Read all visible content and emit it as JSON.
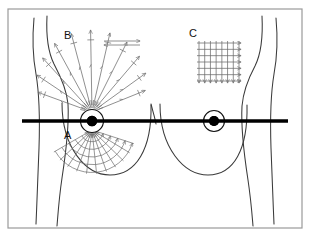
{
  "figure": {
    "background_color": "#ffffff",
    "frame": {
      "name": "outer-frame",
      "x": 8,
      "y": 9,
      "width": 294,
      "height": 219,
      "stroke_color": "#9a9a9a",
      "stroke_width": 1.2
    },
    "ink_color": "#1a1a1a",
    "pattern_color": "#6b6b6b",
    "line_color": "#3a3a3a"
  },
  "labels": [
    {
      "id": "label-a",
      "text": "A",
      "x": 64,
      "y": 139,
      "description": "Wedge / radial spokes pattern on lower breast"
    },
    {
      "id": "label-b",
      "text": "B",
      "x": 64,
      "y": 39,
      "description": "Radial spoke pattern from nipple outward"
    },
    {
      "id": "label-c",
      "text": "C",
      "x": 189,
      "y": 37,
      "description": "Vertical strip / grid pattern"
    }
  ],
  "body": {
    "name": "torso-outline",
    "left_arm_path": "M 34,18 C 32,40 33,58 36,74 C 39,92 40,118 39,148 C 38,178 37,200 36,224",
    "left_side_path": "M 47,16 C 46,36 48,52 54,64 C 62,79 67,92 68,104 C 69,122 66,152 62,178 C 59,198 58,214 57,226",
    "right_side_path": "M 262,16 C 263,36 261,54 255,66 C 247,81 243,94 242,106 C 241,124 244,154 248,180 C 251,200 252,214 253,226",
    "right_arm_path": "M 276,18 C 278,40 277,58 274,74 C 271,92 270,118 271,148 C 272,178 273,200 274,224",
    "left_breast_path": "M 62,103 C 62,148 86,175 110,175 C 136,175 152,149 151,105",
    "right_breast_path": "M 160,104 C 160,148 184,175 208,175 C 234,175 248,149 247,105",
    "sternum_notch_path": "M 151,104 C 153,112 155,118 156,124"
  },
  "nipples": [
    {
      "id": "left-nipple",
      "side": "left",
      "center_x": 92,
      "center_y": 121,
      "areola_radius": 11.5,
      "nipple_radius": 5.2
    },
    {
      "id": "right-nipple",
      "side": "right",
      "center_x": 214,
      "center_y": 121,
      "areola_radius": 10.5,
      "nipple_radius": 5.0
    }
  ],
  "horizontal_reference_line": {
    "name": "horizontal-reference-line",
    "x1": 22,
    "x2": 288,
    "y": 121,
    "stroke_width": 3.4,
    "color": "#000000"
  },
  "patterns": {
    "b_radial": {
      "name": "radial-spokes-upper",
      "label": "B",
      "origin_x": 92,
      "origin_y": 112,
      "spoke_count": 11,
      "start_angle_deg": -160,
      "end_angle_deg": -22,
      "inner_radius": 4,
      "outer_radius": 82,
      "arrowheads": "outward",
      "cross_ticks": true,
      "top_bracket": {
        "x1": 104,
        "y1": 41,
        "x2": 140,
        "y2": 41,
        "x3": 104,
        "y3": 45,
        "x4": 140,
        "y4": 45
      }
    },
    "a_wedge": {
      "name": "wedge-grid-lower",
      "label": "A",
      "origin_x": 92,
      "origin_y": 130,
      "spoke_count": 11,
      "start_angle_deg": 18,
      "end_angle_deg": 150,
      "inner_radius": 4,
      "outer_radius": 44,
      "arc_count": 5,
      "arrowheads": "rightward"
    },
    "c_grid": {
      "name": "vertical-strip-grid",
      "label": "C",
      "x": 199,
      "y": 43,
      "width": 40,
      "height": 38,
      "columns": 8,
      "rows": 7,
      "arrowheads": "right-and-down"
    }
  }
}
